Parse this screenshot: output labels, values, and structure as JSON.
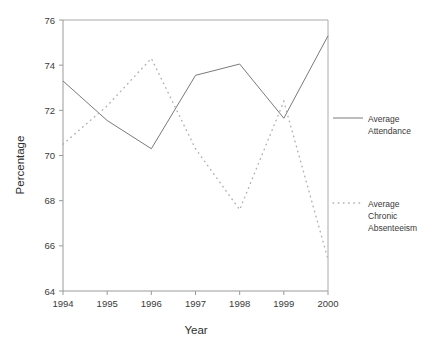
{
  "chart_data": {
    "type": "line",
    "title": "",
    "xlabel": "Year",
    "ylabel": "Percentage",
    "categories": [
      "1994",
      "1995",
      "1996",
      "1997",
      "1998",
      "1999",
      "2000"
    ],
    "x": [
      1994,
      1995,
      1996,
      1997,
      1998,
      1999,
      2000
    ],
    "xlim": [
      1994,
      2000
    ],
    "ylim": [
      64,
      76
    ],
    "ytick_labels": [
      "64",
      "66",
      "68",
      "70",
      "72",
      "74",
      "76"
    ],
    "yticks": [
      64,
      66,
      68,
      70,
      72,
      74,
      76
    ],
    "grid": false,
    "legend_position": "right",
    "series": [
      {
        "name": "Average Attendance",
        "style": "solid",
        "color": "#7a7a7a",
        "values": [
          73.3,
          71.55,
          70.3,
          73.55,
          74.05,
          71.65,
          75.3
        ]
      },
      {
        "name": "Average Chronic Absenteeism",
        "style": "dotted",
        "color": "#b0b0b0",
        "values": [
          70.5,
          72.2,
          74.3,
          70.3,
          67.6,
          72.4,
          65.4
        ]
      }
    ]
  },
  "legend": {
    "entries": [
      {
        "label_line1": "Average",
        "label_line2": "Attendance",
        "label_line3": ""
      },
      {
        "label_line1": "Average",
        "label_line2": "Chronic",
        "label_line3": "Absenteeism"
      }
    ]
  },
  "axes": {
    "x_title": "Year",
    "y_title": "Percentage"
  },
  "colors": {
    "series_solid": "#7a7a7a",
    "series_dotted": "#b0b0b0",
    "axis": "#9a9a9a",
    "text": "#3a3a3a",
    "background": "#ffffff"
  }
}
